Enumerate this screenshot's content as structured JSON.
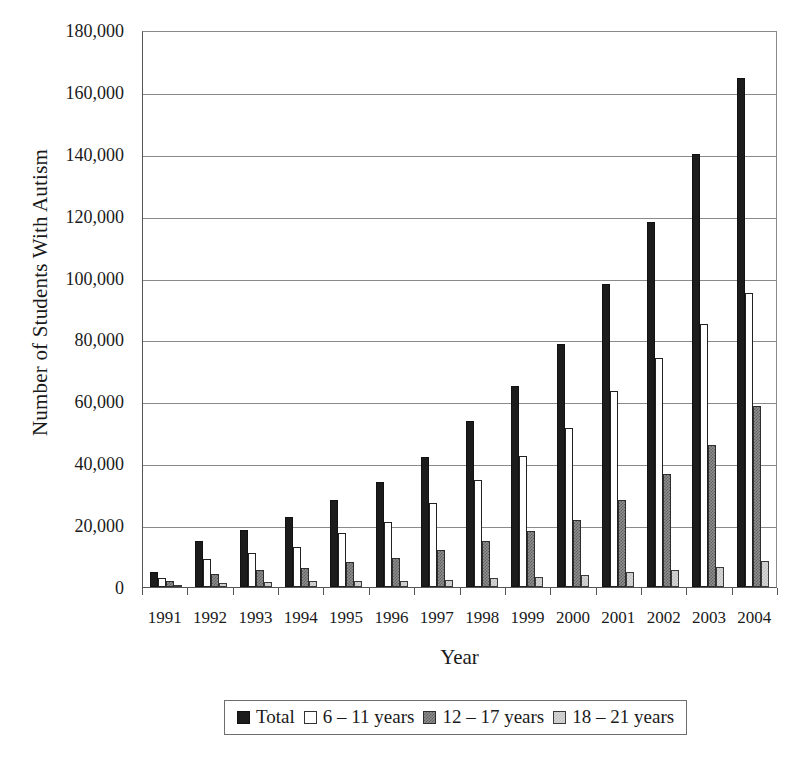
{
  "chart_data": {
    "type": "bar",
    "title": "",
    "xlabel": "Year",
    "ylabel": "Number of Students With Autism",
    "ylim": [
      0,
      180000
    ],
    "ytick_step": 20000,
    "ytick_labels": [
      "180,000",
      "160,000",
      "140,000",
      "120,000",
      "100,000",
      "80,000",
      "60,000",
      "40,000",
      "20,000",
      "0"
    ],
    "grid": true,
    "legend_position": "bottom",
    "categories": [
      "1991",
      "1992",
      "1993",
      "1994",
      "1995",
      "1996",
      "1997",
      "1998",
      "1999",
      "2000",
      "2001",
      "2002",
      "2003",
      "2004"
    ],
    "series": [
      {
        "name": "Total",
        "style": "solid-black",
        "values": [
          5000,
          15000,
          18500,
          22500,
          28000,
          34000,
          42000,
          53500,
          65000,
          78500,
          98000,
          118000,
          140000,
          164500
        ]
      },
      {
        "name": "6 – 11 years",
        "style": "white",
        "values": [
          2800,
          9000,
          11000,
          13000,
          17500,
          21000,
          27000,
          34500,
          42500,
          51500,
          63500,
          74000,
          85000,
          95000
        ]
      },
      {
        "name": "12 – 17 years",
        "style": "dark-hatch",
        "values": [
          1800,
          4200,
          5500,
          6000,
          8000,
          9500,
          12000,
          15000,
          18000,
          21500,
          28000,
          36500,
          46000,
          58500
        ]
      },
      {
        "name": "18 – 21 years",
        "style": "light-hatch",
        "values": [
          400,
          1400,
          1700,
          1800,
          1800,
          2100,
          2400,
          2800,
          3300,
          4000,
          4800,
          5500,
          6500,
          8500
        ]
      }
    ]
  },
  "legend": {
    "items": [
      {
        "label": "Total"
      },
      {
        "label": "6 – 11 years"
      },
      {
        "label": "12 – 17 years"
      },
      {
        "label": "18 – 21 years"
      }
    ]
  }
}
